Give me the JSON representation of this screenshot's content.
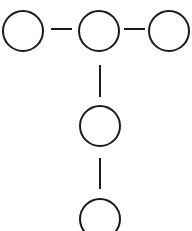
{
  "diagram": {
    "type": "tree",
    "stroke_color": "#1a1a1a",
    "background": "#ffffff",
    "nodes": [
      {
        "id": "n1",
        "cx": 23,
        "cy": 31,
        "r": 20
      },
      {
        "id": "n2",
        "cx": 99,
        "cy": 31,
        "r": 20
      },
      {
        "id": "n3",
        "cx": 169,
        "cy": 31,
        "r": 20
      },
      {
        "id": "n4",
        "cx": 100,
        "cy": 126,
        "r": 20
      },
      {
        "id": "n5",
        "cx": 100,
        "cy": 219,
        "r": 20
      }
    ],
    "edges": [
      {
        "from": "n1",
        "to": "n2",
        "x1": 51,
        "y1": 29,
        "x2": 72,
        "y2": 29
      },
      {
        "from": "n2",
        "to": "n3",
        "x1": 124,
        "y1": 29,
        "x2": 145,
        "y2": 29
      },
      {
        "from": "n2",
        "to": "n4",
        "x1": 100,
        "y1": 65,
        "x2": 100,
        "y2": 97
      },
      {
        "from": "n4",
        "to": "n5",
        "x1": 100,
        "y1": 158,
        "x2": 100,
        "y2": 189
      }
    ]
  }
}
